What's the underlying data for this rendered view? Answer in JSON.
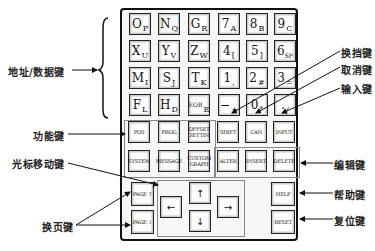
{
  "address_data_keys": [
    {
      "main": "O",
      "sub": "P"
    },
    {
      "main": "N",
      "sub": "Q"
    },
    {
      "main": "G",
      "sub": "R"
    },
    {
      "main": "7",
      "sub": "A"
    },
    {
      "main": "8",
      "sub": "B"
    },
    {
      "main": "9",
      "sub": "C"
    },
    {
      "main": "X",
      "sub": "U"
    },
    {
      "main": "Y",
      "sub": "V"
    },
    {
      "main": "Z",
      "sub": "W"
    },
    {
      "main": "4",
      "sub": "["
    },
    {
      "main": "5",
      "sub": "]"
    },
    {
      "main": "6",
      "sub": "SP"
    },
    {
      "main": "M",
      "sub": "I"
    },
    {
      "main": "S",
      "sub": "J"
    },
    {
      "main": "T",
      "sub": "K"
    },
    {
      "main": "1",
      "sub": ","
    },
    {
      "main": "2",
      "sub": "#"
    },
    {
      "main": "3",
      "sub": "="
    },
    {
      "main": "F",
      "sub": "L"
    },
    {
      "main": "H",
      "sub": "D"
    },
    {
      "main": "EOB",
      "sub": "E"
    },
    {
      "main": "−",
      "sub": "+"
    },
    {
      "main": "0",
      "sub": "*"
    },
    {
      "main": ".",
      "sub": "/"
    }
  ],
  "function_keys": [
    "POS",
    "PROG",
    "OFFSET SETTIN",
    "SYSTEM",
    "MESSAGE",
    "CUSTOM GRAPH"
  ],
  "edit_row1": [
    "SHIFT",
    "CAN",
    "INPUT"
  ],
  "edit_row2": [
    "ALTER",
    "INSERT",
    "DELETE"
  ],
  "page_keys": {
    "up": "PAGE ↑",
    "down": "PAGE ↓"
  },
  "cursor_keys": {
    "up": "↑",
    "down": "↓",
    "left": "←",
    "right": "→"
  },
  "help_key": "HELP",
  "reset_key": "RESET",
  "labels": {
    "address_data": "地址/数据键",
    "function": "功能键",
    "cursor": "光标移动键",
    "page": "换页键",
    "shift": "换挡键",
    "cancel": "取消键",
    "input": "输入键",
    "edit": "编辑键",
    "help": "帮助键",
    "reset": "复位键"
  }
}
